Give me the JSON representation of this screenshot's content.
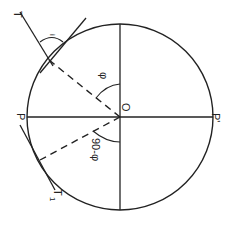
{
  "diagram": {
    "title": "",
    "rotation_deg": 90,
    "colors": {
      "stroke": "#222222",
      "background": "#ffffff"
    },
    "circle": {
      "cx": 120,
      "cy": 117,
      "r": 93
    },
    "labels": {
      "T": "T",
      "T1": "T",
      "T1_sub": "1",
      "i": "i",
      "phi": "φ",
      "O": "O",
      "P": "P",
      "P_prime": "P'",
      "ninety_minus_phi": "90-φ"
    }
  }
}
